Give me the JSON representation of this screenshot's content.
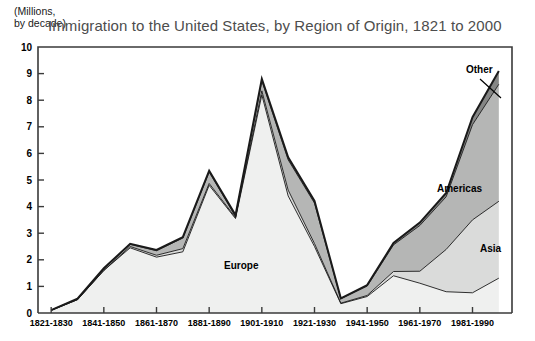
{
  "axis_unit_note": "(Millions,\nby decade)",
  "title": "Immigration to the United States, by Region of Origin, 1821 to 2000",
  "labels": {
    "europe": "Europe",
    "americas": "Americas",
    "asia": "Asia",
    "other": "Other"
  },
  "colors": {
    "europe": "#eff0ef",
    "asia": "#dadbda",
    "americas": "#b5b6b5",
    "other": "#858685",
    "outline": "#1a1a1a",
    "title": "#4d4d4d",
    "axis": "#000000"
  },
  "chart_data": {
    "type": "area",
    "stacked": true,
    "title": "Immigration to the United States, by Region of Origin, 1821 to 2000",
    "xlabel": "",
    "ylabel": "(Millions, by decade)",
    "ylim": [
      0,
      10
    ],
    "yticks": [
      0,
      1,
      2,
      3,
      4,
      5,
      6,
      7,
      8,
      9,
      10
    ],
    "ytick_labels": [
      "0",
      "1",
      "2",
      "3",
      "4",
      "5",
      "6",
      "7",
      "8",
      "9",
      "10"
    ],
    "grid": false,
    "legend": "inline-annotations",
    "categories": [
      "1821-1830",
      "1831-1840",
      "1841-1850",
      "1851-1860",
      "1861-1870",
      "1871-1880",
      "1881-1890",
      "1891-1900",
      "1901-1910",
      "1911-1920",
      "1921-1930",
      "1931-1940",
      "1941-1950",
      "1951-1960",
      "1961-1970",
      "1971-1980",
      "1981-1990",
      "1991-2000"
    ],
    "xtick_labels_shown": [
      "1821-1830",
      "1841-1850",
      "1861-1870",
      "1881-1890",
      "1901-1910",
      "1921-1930",
      "1941-1950",
      "1961-1970",
      "1981-1990"
    ],
    "series": [
      {
        "name": "Europe",
        "values": [
          0.1,
          0.5,
          1.6,
          2.45,
          2.1,
          2.3,
          4.8,
          3.55,
          8.2,
          4.4,
          2.5,
          0.35,
          0.62,
          1.4,
          1.12,
          0.8,
          0.76,
          1.31
        ]
      },
      {
        "name": "Asia",
        "values": [
          0.0,
          0.0,
          0.0,
          0.05,
          0.07,
          0.12,
          0.07,
          0.04,
          0.15,
          0.22,
          0.11,
          0.02,
          0.04,
          0.16,
          0.45,
          1.59,
          2.74,
          2.89
        ]
      },
      {
        "name": "Americas",
        "values": [
          0.01,
          0.03,
          0.07,
          0.08,
          0.17,
          0.4,
          0.43,
          0.04,
          0.38,
          1.14,
          1.52,
          0.16,
          0.35,
          1.0,
          1.72,
          1.98,
          3.58,
          4.4
        ]
      },
      {
        "name": "Other",
        "values": [
          0.0,
          0.01,
          0.01,
          0.02,
          0.03,
          0.03,
          0.05,
          0.05,
          0.07,
          0.09,
          0.08,
          0.02,
          0.04,
          0.07,
          0.11,
          0.14,
          0.28,
          0.5
        ]
      }
    ],
    "totals": [
      0.11,
      0.54,
      1.68,
      2.6,
      2.37,
      2.85,
      5.35,
      3.68,
      8.8,
      5.85,
      4.21,
      0.55,
      1.05,
      2.63,
      3.4,
      4.51,
      7.36,
      9.1
    ],
    "annotations": [
      {
        "text": "Europe",
        "x_category": "1901-1910",
        "note": "inside lightest band"
      },
      {
        "text": "Americas",
        "x_category": "1981-1990",
        "note": "inside mid-gray band"
      },
      {
        "text": "Asia",
        "x_category": "1991-2000",
        "note": "inside light-gray band"
      },
      {
        "text": "Other",
        "x_category": "1991-2000",
        "note": "leader line to dark top band"
      }
    ]
  }
}
